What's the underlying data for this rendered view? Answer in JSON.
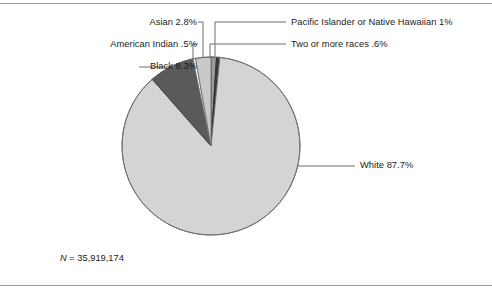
{
  "figure": {
    "background_color": "#ffffff",
    "rule_color": "#9a9a9a",
    "n_label": "N = 35,919,174",
    "n_symbol": "N",
    "n_value": " = 35,919,174"
  },
  "chart_data": {
    "type": "pie",
    "title": "",
    "subtitle": "",
    "xlabel": "",
    "ylabel": "",
    "legend_position": "callout-labels",
    "grid": false,
    "total_label": "N = 35,919,174",
    "total_value": 35919174,
    "start_angle_deg": 0,
    "direction": "clockwise",
    "categories": [
      "White",
      "Black",
      "American Indian",
      "Asian",
      "Pacific Islander or Native Hawaiian",
      "Two or more races"
    ],
    "values": [
      87.7,
      8.3,
      0.5,
      2.8,
      1.0,
      0.6
    ],
    "units": "percent",
    "slices": [
      {
        "name": "White",
        "value": 87.7,
        "label": "White 87.7%",
        "color": "#d4d4d4",
        "stroke": "#6f6f6f"
      },
      {
        "name": "Black",
        "value": 8.3,
        "label": "Black 8.3%",
        "color": "#5a5a5a",
        "stroke": "#3c3c3c"
      },
      {
        "name": "American Indian",
        "value": 0.5,
        "label": "American Indian .5%",
        "color": "#ffffff",
        "stroke": "#6f6f6f"
      },
      {
        "name": "Asian",
        "value": 2.8,
        "label": "Asian 2.8%",
        "color": "#c9c9c9",
        "stroke": "#6f6f6f"
      },
      {
        "name": "Pacific Islander or Native Hawaiian",
        "value": 1.0,
        "label": "Pacific Islander or Native Hawaiian 1%",
        "color": "#9b9b9b",
        "stroke": "#3c3c3c"
      },
      {
        "name": "Two or more races",
        "value": 0.6,
        "label": "Two or more races .6%",
        "color": "#3a3a3a",
        "stroke": "#2a2a2a"
      }
    ]
  },
  "callouts": {
    "asian": "Asian 2.8%",
    "american_indian": "American Indian .5%",
    "black": "Black 8.3%",
    "pacific_islander": "Pacific Islander or Native Hawaiian 1%",
    "two_or_more": "Two or more races .6%",
    "white": "White 87.7%"
  }
}
